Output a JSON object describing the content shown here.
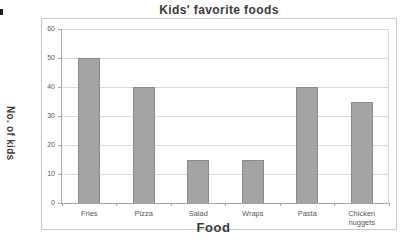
{
  "chart_data": {
    "type": "bar",
    "title": "Kids' favorite foods",
    "xlabel": "Food",
    "ylabel": "No. of kids",
    "categories": [
      "Fries",
      "Pizza",
      "Salad",
      "Wraps",
      "Pasta",
      "Chicken nuggets"
    ],
    "values": [
      50,
      40,
      15,
      15,
      40,
      35
    ],
    "ylim": [
      0,
      60
    ],
    "ytick_step": 10,
    "yticks": [
      0,
      10,
      20,
      30,
      40,
      50,
      60
    ],
    "grid": true,
    "legend": false,
    "colors": {
      "bar_fill": "#a4a4a4",
      "bar_border": "#8a8a8a",
      "gridline": "#d9d9d9",
      "axis_line": "#a6a6a6",
      "frame_border": "#c9c9c9",
      "title_text": "#3b3b3b",
      "axis_title_text": "#3b3b3b",
      "tick_text": "#595959"
    }
  }
}
